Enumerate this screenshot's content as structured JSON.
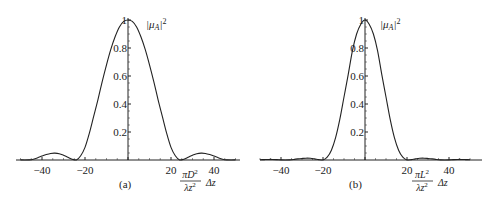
{
  "chart_data": [
    {
      "type": "line",
      "panel_label": "(a)",
      "title": "",
      "ylabel": "|μ_A|²",
      "ylabel_parts": {
        "base": "|μ",
        "sub": "A",
        "close": "|",
        "sup": "2"
      },
      "xlabel": "(πD²/λz²) Δz",
      "xlabel_parts": {
        "num": "πD",
        "num_sup": "2",
        "den": "λz",
        "den_sup": "2",
        "tail": "Δz"
      },
      "xlim": [
        -52,
        52
      ],
      "ylim": [
        0,
        1
      ],
      "x_ticks": [
        -40,
        -20,
        20,
        40
      ],
      "x_tick_labels": [
        "−40",
        "−20",
        "20",
        "40"
      ],
      "y_ticks": [
        0.2,
        0.4,
        0.6,
        0.8,
        1
      ],
      "y_tick_labels": [
        "0.2",
        "0.4",
        "0.6",
        "0.8",
        "1"
      ],
      "grid": false,
      "symmetric": true,
      "x": [
        0,
        2,
        4,
        6,
        8,
        10,
        12,
        14,
        16,
        18,
        20,
        22,
        24,
        26,
        28,
        30,
        32,
        34,
        36,
        38,
        40,
        42,
        44,
        46,
        48,
        50
      ],
      "values": [
        1,
        0.99,
        0.95,
        0.88,
        0.79,
        0.68,
        0.56,
        0.43,
        0.31,
        0.19,
        0.09,
        0.03,
        0.0,
        0.006,
        0.02,
        0.034,
        0.045,
        0.049,
        0.047,
        0.039,
        0.028,
        0.016,
        0.006,
        0.001,
        0.0,
        0.001
      ]
    },
    {
      "type": "line",
      "panel_label": "(b)",
      "title": "",
      "ylabel": "|μ_A|²",
      "ylabel_parts": {
        "base": "|μ",
        "sub": "A",
        "close": "|",
        "sup": "2"
      },
      "xlabel": "(πL²/λz²) Δz",
      "xlabel_parts": {
        "num": "πL",
        "num_sup": "2",
        "den": "λz",
        "den_sup": "2",
        "tail": "Δz"
      },
      "xlim": [
        -52,
        52
      ],
      "ylim": [
        0,
        1
      ],
      "x_ticks": [
        -40,
        -20,
        20,
        40
      ],
      "x_tick_labels": [
        "−40",
        "−20",
        "20",
        "40"
      ],
      "y_ticks": [
        0.2,
        0.4,
        0.6,
        0.8,
        1
      ],
      "y_tick_labels": [
        "0.2",
        "0.4",
        "0.6",
        "0.8",
        "1"
      ],
      "grid": false,
      "symmetric": true,
      "x": [
        0,
        2,
        4,
        6,
        8,
        10,
        12,
        14,
        16,
        18,
        20,
        22,
        24,
        26,
        28,
        30,
        32,
        34,
        36,
        38,
        40,
        42,
        44,
        46,
        48,
        50
      ],
      "values": [
        1,
        0.97,
        0.9,
        0.78,
        0.61,
        0.45,
        0.29,
        0.16,
        0.07,
        0.02,
        0.0,
        0.003,
        0.008,
        0.012,
        0.013,
        0.011,
        0.008,
        0.004,
        0.001,
        0.0,
        0.001,
        0.003,
        0.004,
        0.004,
        0.003,
        0.002
      ]
    }
  ]
}
